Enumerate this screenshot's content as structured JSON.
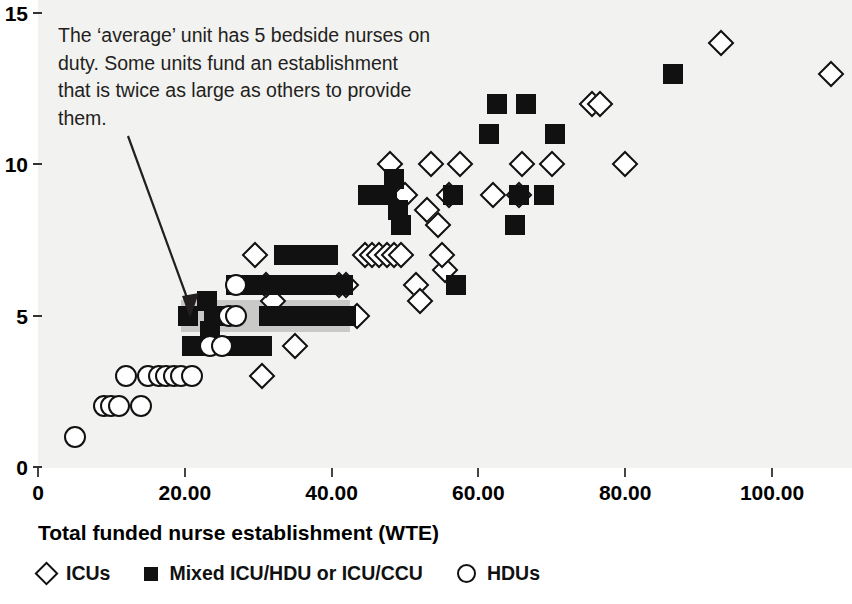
{
  "chart_data": {
    "type": "scatter",
    "title": "",
    "xlabel": "Total funded nurse establishment (WTE)",
    "ylabel": "",
    "xlim": [
      0,
      110
    ],
    "ylim": [
      0,
      15
    ],
    "grid": false,
    "legend_position": "bottom-left",
    "x_ticks": [
      "0",
      "20.00",
      "40.00",
      "60.00",
      "80.00",
      "100.00"
    ],
    "x_tick_values": [
      0,
      20,
      40,
      60,
      80,
      100
    ],
    "y_ticks": [
      "0",
      "5",
      "10",
      "15"
    ],
    "y_tick_values": [
      0,
      5,
      10,
      15
    ],
    "annotation": "The ‘average’ unit has 5 bedside nurses on duty. Some units fund an establishment that is twice as large as others to provide them.",
    "highlight_band": {
      "y": 5,
      "x_start": 19.5,
      "x_end": 42.5,
      "color": "#c9c9c7"
    },
    "series": [
      {
        "name": "ICUs",
        "marker": "diamond",
        "color": "#ffffff",
        "edge_color": "#111111",
        "points": [
          [
            29.5,
            7.0
          ],
          [
            30.5,
            3.0
          ],
          [
            35.0,
            4.0
          ],
          [
            32.0,
            5.5
          ],
          [
            31.0,
            6.0
          ],
          [
            41.0,
            6.0
          ],
          [
            42.0,
            6.0
          ],
          [
            43.5,
            5.0
          ],
          [
            44.5,
            7.0
          ],
          [
            45.5,
            7.0
          ],
          [
            46.5,
            7.0
          ],
          [
            47.5,
            7.0
          ],
          [
            48.5,
            7.0
          ],
          [
            49.5,
            7.0
          ],
          [
            48.0,
            10.0
          ],
          [
            50.0,
            9.0
          ],
          [
            53.0,
            8.5
          ],
          [
            53.5,
            10.0
          ],
          [
            54.5,
            8.0
          ],
          [
            56.0,
            9.0
          ],
          [
            55.5,
            6.5
          ],
          [
            55.0,
            7.0
          ],
          [
            57.5,
            10.0
          ],
          [
            51.5,
            6.0
          ],
          [
            52.0,
            5.5
          ],
          [
            62.0,
            9.0
          ],
          [
            66.0,
            10.0
          ],
          [
            65.5,
            9.0
          ],
          [
            70.0,
            10.0
          ],
          [
            75.5,
            12.0
          ],
          [
            76.5,
            12.0
          ],
          [
            80.0,
            10.0
          ],
          [
            93.0,
            14.0
          ],
          [
            108.0,
            13.0
          ]
        ]
      },
      {
        "name": "Mixed ICU/HDU or ICU/CCU",
        "marker": "square",
        "color": "#111111",
        "edge_color": "#111111",
        "points": [
          [
            20.5,
            5.0
          ],
          [
            23.0,
            5.5
          ],
          [
            21.0,
            4.0
          ],
          [
            22.0,
            4.0
          ],
          [
            23.5,
            4.5
          ],
          [
            24.0,
            5.0
          ],
          [
            25.5,
            5.0
          ],
          [
            26.5,
            4.0
          ],
          [
            27.5,
            4.0
          ],
          [
            28.5,
            4.0
          ],
          [
            29.5,
            4.0
          ],
          [
            30.5,
            4.0
          ],
          [
            31.5,
            5.0
          ],
          [
            32.5,
            5.0
          ],
          [
            33.5,
            5.0
          ],
          [
            34.5,
            5.0
          ],
          [
            35.5,
            5.0
          ],
          [
            36.5,
            5.0
          ],
          [
            37.5,
            5.0
          ],
          [
            38.5,
            5.0
          ],
          [
            39.5,
            5.0
          ],
          [
            42.0,
            5.0
          ],
          [
            27.0,
            6.0
          ],
          [
            28.0,
            6.0
          ],
          [
            29.0,
            6.0
          ],
          [
            30.0,
            6.0
          ],
          [
            31.0,
            6.0
          ],
          [
            32.0,
            6.0
          ],
          [
            33.0,
            6.0
          ],
          [
            34.0,
            6.0
          ],
          [
            35.0,
            6.0
          ],
          [
            36.0,
            6.0
          ],
          [
            37.0,
            6.0
          ],
          [
            38.0,
            6.0
          ],
          [
            39.5,
            6.0
          ],
          [
            41.5,
            6.0
          ],
          [
            33.5,
            7.0
          ],
          [
            34.5,
            7.0
          ],
          [
            35.5,
            7.0
          ],
          [
            36.5,
            7.0
          ],
          [
            37.5,
            7.0
          ],
          [
            38.5,
            7.0
          ],
          [
            39.5,
            7.0
          ],
          [
            47.5,
            9.0
          ],
          [
            48.5,
            9.5
          ],
          [
            49.0,
            8.5
          ],
          [
            49.5,
            8.0
          ],
          [
            45.0,
            9.0
          ],
          [
            46.0,
            9.0
          ],
          [
            57.0,
            6.0
          ],
          [
            56.5,
            9.0
          ],
          [
            61.5,
            11.0
          ],
          [
            62.5,
            12.0
          ],
          [
            65.0,
            8.0
          ],
          [
            66.5,
            12.0
          ],
          [
            65.5,
            9.0
          ],
          [
            69.0,
            9.0
          ],
          [
            70.5,
            11.0
          ],
          [
            86.5,
            13.0
          ]
        ]
      },
      {
        "name": "HDUs",
        "marker": "circle",
        "color": "#ffffff",
        "edge_color": "#111111",
        "points": [
          [
            5.0,
            1.0
          ],
          [
            9.0,
            2.0
          ],
          [
            10.0,
            2.0
          ],
          [
            11.0,
            2.0
          ],
          [
            14.0,
            2.0
          ],
          [
            12.0,
            3.0
          ],
          [
            15.0,
            3.0
          ],
          [
            16.5,
            3.0
          ],
          [
            17.5,
            3.0
          ],
          [
            18.5,
            3.0
          ],
          [
            19.5,
            3.0
          ],
          [
            21.0,
            3.0
          ],
          [
            23.5,
            4.0
          ],
          [
            25.0,
            4.0
          ],
          [
            26.0,
            5.0
          ],
          [
            27.0,
            5.0
          ],
          [
            27.0,
            6.0
          ]
        ]
      }
    ]
  },
  "axis": {
    "x_title": "Total funded nurse establishment (WTE)"
  },
  "legend": {
    "items": [
      {
        "label": "ICUs",
        "marker": "diamond"
      },
      {
        "label": "Mixed ICU/HDU or ICU/CCU",
        "marker": "square"
      },
      {
        "label": "HDUs",
        "marker": "circle"
      }
    ]
  },
  "colors": {
    "panel_background": "#f2f2f0",
    "marker_dark": "#111111",
    "marker_light": "#ffffff",
    "highlight": "#c9c9c7",
    "text": "#231f20"
  }
}
